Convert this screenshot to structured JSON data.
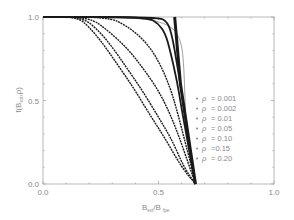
{
  "chart_data": {
    "type": "line",
    "title": "",
    "xlabel": "B_ext / B_fpe",
    "xlabel_main": "B",
    "xlabel_sub1": "ext",
    "xlabel_sep": "/B",
    "xlabel_sub2": "fpe",
    "ylabel": "f(B_ext, ρ)",
    "ylabel_prefix": "f(B",
    "ylabel_sub": "ext",
    "ylabel_suffix": ",ρ)",
    "xlim": [
      0.0,
      1.0
    ],
    "ylim": [
      0.0,
      1.0
    ],
    "xticks": [
      {
        "value": 0.0,
        "label": "0.0"
      },
      {
        "value": 0.5,
        "label": "0.5"
      },
      {
        "value": 1.0,
        "label": "1.0"
      }
    ],
    "yticks": [
      {
        "value": 0.0,
        "label": "0.0"
      },
      {
        "value": 0.5,
        "label": "0.5"
      },
      {
        "value": 1.0,
        "label": "1.0"
      }
    ],
    "grid": false,
    "legend_position": "lower right inside",
    "series": [
      {
        "name": "ρ = 0.001",
        "rho_label": "= 0.001",
        "style": "thin",
        "x": [
          0.0,
          0.42,
          0.56,
          0.6,
          0.61,
          0.615,
          0.62,
          0.63,
          0.65,
          0.66
        ],
        "y": [
          1.0,
          1.0,
          0.95,
          0.85,
          0.7,
          0.5,
          0.3,
          0.2,
          0.07,
          0.0
        ]
      },
      {
        "name": "ρ = 0.002",
        "rho_label": "= 0.002",
        "style": "thick",
        "x": [
          0.0,
          0.5,
          0.54,
          0.56,
          0.58,
          0.6,
          0.62,
          0.64,
          0.66
        ],
        "y": [
          1.0,
          1.0,
          0.97,
          0.88,
          0.72,
          0.55,
          0.36,
          0.18,
          0.0
        ]
      },
      {
        "name": "ρ = 0.01",
        "rho_label": "= 0.01",
        "style": "thick",
        "x": [
          0.0,
          0.45,
          0.5,
          0.53,
          0.55,
          0.58,
          0.6,
          0.62,
          0.64,
          0.66
        ],
        "y": [
          1.0,
          1.0,
          0.96,
          0.9,
          0.8,
          0.62,
          0.45,
          0.3,
          0.15,
          0.0
        ]
      },
      {
        "name": "ρ = 0.05",
        "rho_label": "= 0.05",
        "style": "dotted",
        "x": [
          0.0,
          0.28,
          0.36,
          0.44,
          0.5,
          0.55,
          0.58,
          0.61,
          0.64,
          0.66
        ],
        "y": [
          1.0,
          1.0,
          0.95,
          0.86,
          0.74,
          0.58,
          0.44,
          0.28,
          0.12,
          0.0
        ]
      },
      {
        "name": "ρ = 0.10",
        "rho_label": "= 0.10",
        "style": "dotted",
        "x": [
          0.0,
          0.2,
          0.28,
          0.36,
          0.43,
          0.5,
          0.55,
          0.59,
          0.63,
          0.66
        ],
        "y": [
          1.0,
          1.0,
          0.92,
          0.82,
          0.7,
          0.56,
          0.42,
          0.28,
          0.12,
          0.0
        ]
      },
      {
        "name": "ρ =0.15",
        "rho_label": "=0.15",
        "style": "dotted",
        "x": [
          0.0,
          0.17,
          0.24,
          0.3,
          0.36,
          0.43,
          0.5,
          0.56,
          0.61,
          0.66
        ],
        "y": [
          1.0,
          1.0,
          0.92,
          0.82,
          0.7,
          0.56,
          0.4,
          0.26,
          0.1,
          0.0
        ]
      },
      {
        "name": "ρ = 0.20",
        "rho_label": "= 0.20",
        "style": "dotted",
        "x": [
          0.0,
          0.15,
          0.2,
          0.26,
          0.32,
          0.39,
          0.46,
          0.53,
          0.6,
          0.66
        ],
        "y": [
          1.0,
          1.0,
          0.94,
          0.84,
          0.72,
          0.58,
          0.42,
          0.27,
          0.1,
          0.0
        ]
      }
    ]
  },
  "legend": {
    "symbol": "ρ"
  },
  "colors": {
    "frame": "#a8a8a8",
    "text": "#8a8a8a",
    "curve": "#1a1a1a",
    "thin_curve": "#777777"
  }
}
